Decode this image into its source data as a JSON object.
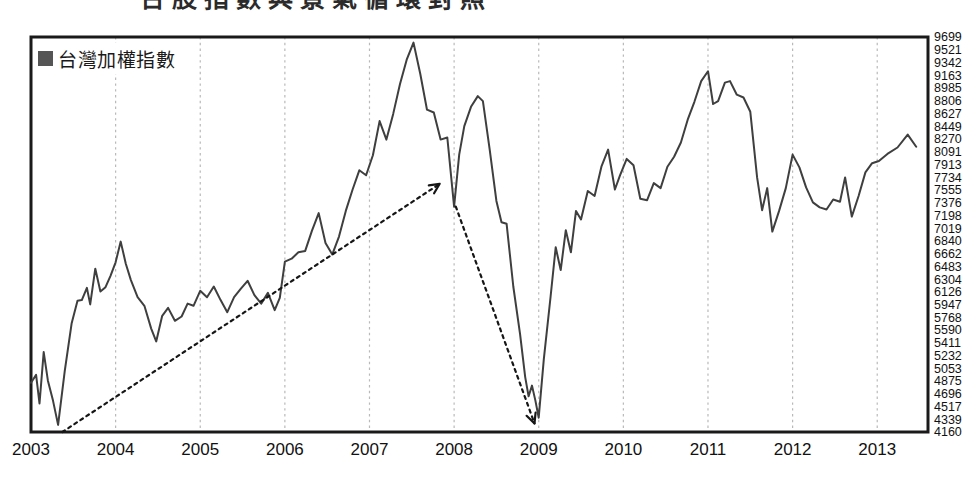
{
  "figure": {
    "title_cropped": "台股指數與景氣循環對照",
    "legend_label": "台灣加權指數",
    "legend_swatch_color": "#555555",
    "line_color": "#3f3f3f",
    "grid_color": "#b9b9b9",
    "frame_color": "#1a1a1a"
  },
  "chart_data": {
    "type": "line",
    "title": "",
    "xlabel": "",
    "ylabel": "",
    "grid": true,
    "legend_position": "top-left",
    "series": [
      {
        "name": "台灣加權指數",
        "color": "#3f3f3f",
        "points": [
          [
            2003.0,
            4850
          ],
          [
            2003.06,
            4960
          ],
          [
            2003.1,
            4560
          ],
          [
            2003.15,
            5280
          ],
          [
            2003.2,
            4880
          ],
          [
            2003.26,
            4600
          ],
          [
            2003.32,
            4260
          ],
          [
            2003.4,
            5020
          ],
          [
            2003.48,
            5680
          ],
          [
            2003.55,
            6000
          ],
          [
            2003.6,
            6010
          ],
          [
            2003.66,
            6180
          ],
          [
            2003.7,
            5950
          ],
          [
            2003.76,
            6450
          ],
          [
            2003.82,
            6130
          ],
          [
            2003.88,
            6190
          ],
          [
            2003.94,
            6350
          ],
          [
            2004.0,
            6540
          ],
          [
            2004.06,
            6830
          ],
          [
            2004.12,
            6520
          ],
          [
            2004.18,
            6290
          ],
          [
            2004.26,
            6050
          ],
          [
            2004.34,
            5930
          ],
          [
            2004.42,
            5610
          ],
          [
            2004.48,
            5430
          ],
          [
            2004.55,
            5790
          ],
          [
            2004.62,
            5900
          ],
          [
            2004.7,
            5720
          ],
          [
            2004.78,
            5780
          ],
          [
            2004.85,
            5960
          ],
          [
            2004.92,
            5930
          ],
          [
            2005.0,
            6140
          ],
          [
            2005.08,
            6050
          ],
          [
            2005.16,
            6200
          ],
          [
            2005.24,
            6010
          ],
          [
            2005.32,
            5840
          ],
          [
            2005.4,
            6050
          ],
          [
            2005.48,
            6170
          ],
          [
            2005.56,
            6280
          ],
          [
            2005.64,
            6080
          ],
          [
            2005.72,
            5960
          ],
          [
            2005.8,
            6110
          ],
          [
            2005.88,
            5870
          ],
          [
            2005.94,
            6040
          ],
          [
            2006.0,
            6550
          ],
          [
            2006.08,
            6590
          ],
          [
            2006.16,
            6680
          ],
          [
            2006.24,
            6700
          ],
          [
            2006.32,
            6980
          ],
          [
            2006.4,
            7230
          ],
          [
            2006.48,
            6810
          ],
          [
            2006.56,
            6650
          ],
          [
            2006.64,
            6900
          ],
          [
            2006.72,
            7260
          ],
          [
            2006.8,
            7560
          ],
          [
            2006.88,
            7830
          ],
          [
            2006.96,
            7760
          ],
          [
            2007.04,
            8040
          ],
          [
            2007.12,
            8520
          ],
          [
            2007.2,
            8260
          ],
          [
            2007.28,
            8620
          ],
          [
            2007.36,
            9040
          ],
          [
            2007.44,
            9380
          ],
          [
            2007.52,
            9620
          ],
          [
            2007.6,
            9180
          ],
          [
            2007.68,
            8680
          ],
          [
            2007.76,
            8640
          ],
          [
            2007.84,
            8260
          ],
          [
            2007.92,
            8290
          ],
          [
            2008.0,
            7320
          ],
          [
            2008.06,
            8050
          ],
          [
            2008.12,
            8450
          ],
          [
            2008.2,
            8720
          ],
          [
            2008.28,
            8870
          ],
          [
            2008.34,
            8800
          ],
          [
            2008.42,
            8120
          ],
          [
            2008.5,
            7400
          ],
          [
            2008.56,
            7100
          ],
          [
            2008.62,
            7080
          ],
          [
            2008.7,
            6200
          ],
          [
            2008.78,
            5530
          ],
          [
            2008.84,
            4930
          ],
          [
            2008.88,
            4660
          ],
          [
            2008.92,
            4810
          ],
          [
            2008.96,
            4600
          ],
          [
            2009.0,
            4360
          ],
          [
            2009.06,
            5180
          ],
          [
            2009.14,
            6060
          ],
          [
            2009.2,
            6750
          ],
          [
            2009.26,
            6430
          ],
          [
            2009.32,
            6990
          ],
          [
            2009.38,
            6680
          ],
          [
            2009.44,
            7260
          ],
          [
            2009.5,
            7140
          ],
          [
            2009.58,
            7540
          ],
          [
            2009.66,
            7470
          ],
          [
            2009.74,
            7880
          ],
          [
            2009.82,
            8120
          ],
          [
            2009.9,
            7560
          ],
          [
            2009.96,
            7760
          ],
          [
            2010.04,
            7990
          ],
          [
            2010.12,
            7900
          ],
          [
            2010.2,
            7430
          ],
          [
            2010.28,
            7410
          ],
          [
            2010.36,
            7650
          ],
          [
            2010.44,
            7580
          ],
          [
            2010.52,
            7880
          ],
          [
            2010.6,
            8020
          ],
          [
            2010.68,
            8220
          ],
          [
            2010.76,
            8540
          ],
          [
            2010.84,
            8790
          ],
          [
            2010.92,
            9080
          ],
          [
            2011.0,
            9220
          ],
          [
            2011.06,
            8760
          ],
          [
            2011.12,
            8800
          ],
          [
            2011.2,
            9060
          ],
          [
            2011.26,
            9080
          ],
          [
            2011.34,
            8890
          ],
          [
            2011.42,
            8850
          ],
          [
            2011.5,
            8650
          ],
          [
            2011.58,
            7730
          ],
          [
            2011.64,
            7270
          ],
          [
            2011.7,
            7580
          ],
          [
            2011.76,
            6970
          ],
          [
            2011.84,
            7260
          ],
          [
            2011.92,
            7580
          ],
          [
            2012.0,
            8050
          ],
          [
            2012.08,
            7870
          ],
          [
            2012.16,
            7590
          ],
          [
            2012.24,
            7380
          ],
          [
            2012.32,
            7310
          ],
          [
            2012.4,
            7280
          ],
          [
            2012.48,
            7420
          ],
          [
            2012.56,
            7390
          ],
          [
            2012.62,
            7730
          ],
          [
            2012.7,
            7180
          ],
          [
            2012.78,
            7470
          ],
          [
            2012.86,
            7800
          ],
          [
            2012.94,
            7930
          ],
          [
            2013.02,
            7960
          ],
          [
            2013.12,
            8060
          ],
          [
            2013.24,
            8150
          ],
          [
            2013.36,
            8330
          ],
          [
            2013.46,
            8160
          ]
        ]
      }
    ],
    "xlim": [
      2003.0,
      2013.6
    ],
    "ylim": [
      4160,
      9699
    ],
    "x_ticks": [
      "2003",
      "2004",
      "2005",
      "2006",
      "2007",
      "2008",
      "2009",
      "2010",
      "2011",
      "2012",
      "2013"
    ],
    "y_ticks": [
      9699,
      9521,
      9342,
      9163,
      8985,
      8806,
      8627,
      8449,
      8270,
      8091,
      7913,
      7734,
      7555,
      7376,
      7198,
      7019,
      6840,
      6662,
      6483,
      6304,
      6126,
      5947,
      5768,
      5590,
      5411,
      5232,
      5053,
      4875,
      4696,
      4517,
      4339,
      4160
    ],
    "annotations": [
      {
        "name": "uptrend-arrow",
        "type": "dashed-arrow",
        "direction": "up",
        "from": [
          2003.37,
          4160
        ],
        "to": [
          2007.83,
          7640
        ]
      },
      {
        "name": "downtrend-arrow",
        "type": "dashed-arrow",
        "direction": "down",
        "from": [
          2008.02,
          7320
        ],
        "to": [
          2008.95,
          4280
        ]
      }
    ]
  }
}
